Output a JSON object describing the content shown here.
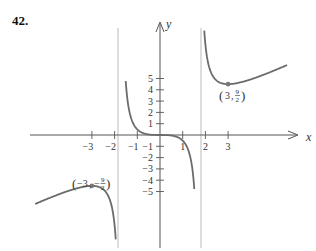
{
  "problem": {
    "number": "42."
  },
  "chart_data": {
    "type": "line",
    "function": "y = x^3 / (x^2 - 3)",
    "xlabel": "x",
    "ylabel": "y",
    "x_ticks": [
      -3,
      -2,
      -1,
      1,
      2,
      3
    ],
    "x_tick_labels": [
      "−3",
      "−2",
      "−1",
      "1",
      "2",
      "3"
    ],
    "y_ticks": [
      5,
      4,
      3,
      2,
      1,
      -1,
      -2,
      -3,
      -4,
      -5
    ],
    "y_tick_labels": [
      "5",
      "4",
      "3",
      "2",
      "1",
      "−1",
      "−2",
      "−3",
      "−4",
      "−5"
    ],
    "vertical_asymptotes": [
      -1.732,
      1.732
    ],
    "points": [
      {
        "x": 3,
        "y": 4.5,
        "label": "(3, 9/2)"
      },
      {
        "x": -3,
        "y": -4.5,
        "label": "(−3, −9/2)"
      }
    ],
    "xlim": [
      -6.2,
      6.8
    ],
    "ylim": [
      -10.2,
      11.9
    ],
    "grid": false,
    "curve_color": "#6b6b6b",
    "axis_color": "#555555",
    "asymptote_color": "#aaaaaa"
  },
  "labels": {
    "x_axis": "x",
    "y_axis": "y",
    "max_point_x": "−3",
    "max_point_num": "9",
    "max_point_den": "2",
    "min_point_x": "3",
    "min_point_num": "9",
    "min_point_den": "2"
  }
}
